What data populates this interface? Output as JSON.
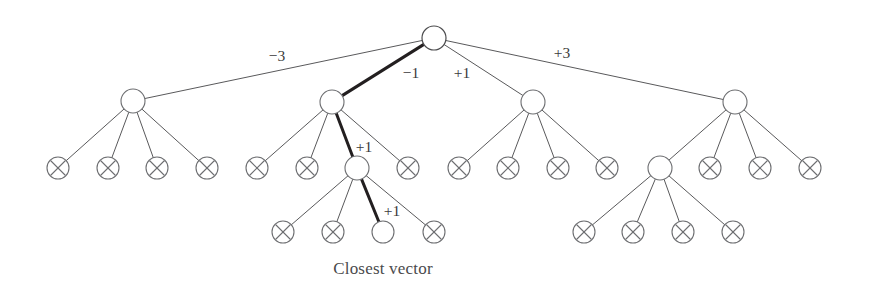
{
  "figure": {
    "caption": "Closest vector",
    "background_color": "#ffffff",
    "edge_color": "#59595b",
    "bold_edge_color": "#231f20",
    "node_stroke_color": "#6d6e71",
    "node_fill_color": "#ffffff",
    "label_color": "#3a3a3c",
    "caption_color": "#4a4a4c"
  },
  "chart_data": {
    "type": "diagram",
    "subtype": "tree",
    "title": "Closest vector",
    "node_radius_internal": 12,
    "node_radius_leaf": 11,
    "levels": [
      38,
      102,
      168,
      232
    ],
    "nodes": [
      {
        "id": "root",
        "x": 434,
        "y": 38,
        "r": 12,
        "kind": "internal",
        "marker": "none",
        "on_path": true
      },
      {
        "id": "n1",
        "x": 133,
        "y": 101,
        "r": 12,
        "kind": "internal",
        "marker": "none",
        "on_path": false
      },
      {
        "id": "n2",
        "x": 332,
        "y": 102,
        "r": 12,
        "kind": "internal",
        "marker": "none",
        "on_path": true
      },
      {
        "id": "n3",
        "x": 533,
        "y": 102,
        "r": 12,
        "kind": "internal",
        "marker": "none",
        "on_path": false
      },
      {
        "id": "n4",
        "x": 735,
        "y": 102,
        "r": 12,
        "kind": "internal",
        "marker": "none",
        "on_path": false
      },
      {
        "id": "n1c1",
        "x": 58,
        "y": 168,
        "r": 11,
        "kind": "leaf",
        "marker": "x",
        "on_path": false
      },
      {
        "id": "n1c2",
        "x": 108,
        "y": 168,
        "r": 11,
        "kind": "leaf",
        "marker": "x",
        "on_path": false
      },
      {
        "id": "n1c3",
        "x": 157,
        "y": 168,
        "r": 11,
        "kind": "leaf",
        "marker": "x",
        "on_path": false
      },
      {
        "id": "n1c4",
        "x": 207,
        "y": 168,
        "r": 11,
        "kind": "leaf",
        "marker": "x",
        "on_path": false
      },
      {
        "id": "n2c1",
        "x": 257,
        "y": 168,
        "r": 11,
        "kind": "leaf",
        "marker": "x",
        "on_path": false
      },
      {
        "id": "n2c2",
        "x": 307,
        "y": 168,
        "r": 11,
        "kind": "leaf",
        "marker": "x",
        "on_path": false
      },
      {
        "id": "n2c3",
        "x": 357,
        "y": 168,
        "r": 12,
        "kind": "internal",
        "marker": "none",
        "on_path": true
      },
      {
        "id": "n2c4",
        "x": 408,
        "y": 168,
        "r": 11,
        "kind": "leaf",
        "marker": "x",
        "on_path": false
      },
      {
        "id": "n3c1",
        "x": 459,
        "y": 168,
        "r": 11,
        "kind": "leaf",
        "marker": "x",
        "on_path": false
      },
      {
        "id": "n3c2",
        "x": 508,
        "y": 168,
        "r": 11,
        "kind": "leaf",
        "marker": "x",
        "on_path": false
      },
      {
        "id": "n3c3",
        "x": 558,
        "y": 168,
        "r": 11,
        "kind": "leaf",
        "marker": "x",
        "on_path": false
      },
      {
        "id": "n3c4",
        "x": 607,
        "y": 168,
        "r": 11,
        "kind": "leaf",
        "marker": "x",
        "on_path": false
      },
      {
        "id": "n4c1",
        "x": 660,
        "y": 168,
        "r": 12,
        "kind": "internal",
        "marker": "none",
        "on_path": false
      },
      {
        "id": "n4c2",
        "x": 710,
        "y": 168,
        "r": 11,
        "kind": "leaf",
        "marker": "x",
        "on_path": false
      },
      {
        "id": "n4c3",
        "x": 760,
        "y": 168,
        "r": 11,
        "kind": "leaf",
        "marker": "x",
        "on_path": false
      },
      {
        "id": "n4c4",
        "x": 810,
        "y": 168,
        "r": 11,
        "kind": "leaf",
        "marker": "x",
        "on_path": false
      },
      {
        "id": "n2c3d1",
        "x": 283,
        "y": 232,
        "r": 11,
        "kind": "leaf",
        "marker": "x",
        "on_path": false
      },
      {
        "id": "n2c3d2",
        "x": 333,
        "y": 232,
        "r": 11,
        "kind": "leaf",
        "marker": "x",
        "on_path": false
      },
      {
        "id": "closest",
        "x": 383,
        "y": 232,
        "r": 11,
        "kind": "leaf",
        "marker": "none",
        "on_path": true
      },
      {
        "id": "n2c3d4",
        "x": 434,
        "y": 232,
        "r": 11,
        "kind": "leaf",
        "marker": "x",
        "on_path": false
      },
      {
        "id": "n4c1d1",
        "x": 584,
        "y": 232,
        "r": 11,
        "kind": "leaf",
        "marker": "x",
        "on_path": false
      },
      {
        "id": "n4c1d2",
        "x": 633,
        "y": 232,
        "r": 11,
        "kind": "leaf",
        "marker": "x",
        "on_path": false
      },
      {
        "id": "n4c1d3",
        "x": 683,
        "y": 232,
        "r": 11,
        "kind": "leaf",
        "marker": "x",
        "on_path": false
      },
      {
        "id": "n4c1d4",
        "x": 733,
        "y": 232,
        "r": 11,
        "kind": "leaf",
        "marker": "x",
        "on_path": false
      }
    ],
    "edges": [
      {
        "from": "root",
        "to": "n1",
        "bold": false,
        "label": "−3"
      },
      {
        "from": "root",
        "to": "n2",
        "bold": true,
        "label": "−1"
      },
      {
        "from": "root",
        "to": "n3",
        "bold": false,
        "label": "+1"
      },
      {
        "from": "root",
        "to": "n4",
        "bold": false,
        "label": "+3"
      },
      {
        "from": "n1",
        "to": "n1c1",
        "bold": false,
        "label": ""
      },
      {
        "from": "n1",
        "to": "n1c2",
        "bold": false,
        "label": ""
      },
      {
        "from": "n1",
        "to": "n1c3",
        "bold": false,
        "label": ""
      },
      {
        "from": "n1",
        "to": "n1c4",
        "bold": false,
        "label": ""
      },
      {
        "from": "n2",
        "to": "n2c1",
        "bold": false,
        "label": ""
      },
      {
        "from": "n2",
        "to": "n2c2",
        "bold": false,
        "label": ""
      },
      {
        "from": "n2",
        "to": "n2c3",
        "bold": true,
        "label": "+1"
      },
      {
        "from": "n2",
        "to": "n2c4",
        "bold": false,
        "label": ""
      },
      {
        "from": "n3",
        "to": "n3c1",
        "bold": false,
        "label": ""
      },
      {
        "from": "n3",
        "to": "n3c2",
        "bold": false,
        "label": ""
      },
      {
        "from": "n3",
        "to": "n3c3",
        "bold": false,
        "label": ""
      },
      {
        "from": "n3",
        "to": "n3c4",
        "bold": false,
        "label": ""
      },
      {
        "from": "n4",
        "to": "n4c1",
        "bold": false,
        "label": ""
      },
      {
        "from": "n4",
        "to": "n4c2",
        "bold": false,
        "label": ""
      },
      {
        "from": "n4",
        "to": "n4c3",
        "bold": false,
        "label": ""
      },
      {
        "from": "n4",
        "to": "n4c4",
        "bold": false,
        "label": ""
      },
      {
        "from": "n2c3",
        "to": "n2c3d1",
        "bold": false,
        "label": ""
      },
      {
        "from": "n2c3",
        "to": "n2c3d2",
        "bold": false,
        "label": ""
      },
      {
        "from": "n2c3",
        "to": "closest",
        "bold": true,
        "label": "+1"
      },
      {
        "from": "n2c3",
        "to": "n2c3d4",
        "bold": false,
        "label": ""
      },
      {
        "from": "n4c1",
        "to": "n4c1d1",
        "bold": false,
        "label": ""
      },
      {
        "from": "n4c1",
        "to": "n4c1d2",
        "bold": false,
        "label": ""
      },
      {
        "from": "n4c1",
        "to": "n4c1d3",
        "bold": false,
        "label": ""
      },
      {
        "from": "n4c1",
        "to": "n4c1d4",
        "bold": false,
        "label": ""
      }
    ],
    "edge_labels": [
      {
        "id": "label-minus-3",
        "text": "−3",
        "x": 277,
        "y": 57
      },
      {
        "id": "label-minus-1",
        "text": "−1",
        "x": 411,
        "y": 74
      },
      {
        "id": "label-plus-1-root",
        "text": "+1",
        "x": 462,
        "y": 74
      },
      {
        "id": "label-plus-3",
        "text": "+3",
        "x": 562,
        "y": 54
      },
      {
        "id": "label-plus-1-mid",
        "text": "+1",
        "x": 364,
        "y": 148
      },
      {
        "id": "label-plus-1-low",
        "text": "+1",
        "x": 392,
        "y": 212
      }
    ],
    "captions": [
      {
        "id": "closest-vector-caption",
        "text": "Closest vector",
        "x": 383,
        "y": 270
      }
    ],
    "path_highlight": {
      "description": "Bold path from root through selected branches to the closest vector leaf",
      "node_sequence": [
        "root",
        "n2",
        "n2c3",
        "closest"
      ],
      "label_sequence": [
        "−1",
        "+1",
        "+1"
      ]
    }
  }
}
